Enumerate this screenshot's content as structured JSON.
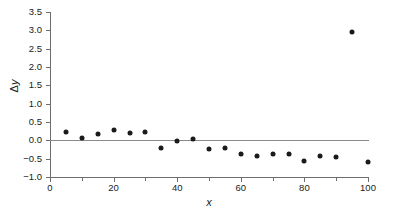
{
  "chart_data": {
    "type": "scatter",
    "title": "",
    "xlabel": "x",
    "ylabel": "Δy",
    "xlim": [
      0,
      100
    ],
    "ylim": [
      -1.0,
      3.5
    ],
    "grid": false,
    "legend": null,
    "zero_reference_line": 0.0,
    "x_ticks": [
      0,
      20,
      40,
      60,
      80,
      100
    ],
    "x_tick_labels": [
      "0",
      "20",
      "40",
      "60",
      "80",
      "100"
    ],
    "x_minor_ticks": [
      10,
      30,
      50,
      70,
      90
    ],
    "y_ticks": [
      -1.0,
      -0.5,
      0.0,
      0.5,
      1.0,
      1.5,
      2.0,
      2.5,
      3.0,
      3.5
    ],
    "y_tick_labels": [
      "−1.0",
      "−0.5",
      "0.0",
      "0.5",
      "1.0",
      "1.5",
      "2.0",
      "2.5",
      "3.0",
      "3.5"
    ],
    "marker": "filled-circle",
    "marker_color": "#1a1a1a",
    "x": [
      5,
      10,
      15,
      20,
      25,
      30,
      35,
      40,
      45,
      50,
      55,
      60,
      65,
      70,
      75,
      80,
      85,
      90,
      95,
      100
    ],
    "y": [
      0.22,
      0.07,
      0.18,
      0.27,
      0.21,
      0.22,
      -0.21,
      -0.03,
      0.04,
      -0.24,
      -0.2,
      -0.37,
      -0.42,
      -0.37,
      -0.38,
      -0.57,
      -0.44,
      -0.46,
      2.95,
      -0.59
    ],
    "points": [
      {
        "x": 5,
        "y": 0.22
      },
      {
        "x": 10,
        "y": 0.07
      },
      {
        "x": 15,
        "y": 0.18
      },
      {
        "x": 20,
        "y": 0.27
      },
      {
        "x": 25,
        "y": 0.21
      },
      {
        "x": 30,
        "y": 0.22
      },
      {
        "x": 35,
        "y": -0.21
      },
      {
        "x": 40,
        "y": -0.03
      },
      {
        "x": 45,
        "y": 0.04
      },
      {
        "x": 50,
        "y": -0.24
      },
      {
        "x": 55,
        "y": -0.2
      },
      {
        "x": 60,
        "y": -0.37
      },
      {
        "x": 65,
        "y": -0.42
      },
      {
        "x": 70,
        "y": -0.37
      },
      {
        "x": 75,
        "y": -0.38
      },
      {
        "x": 80,
        "y": -0.57
      },
      {
        "x": 85,
        "y": -0.44
      },
      {
        "x": 90,
        "y": -0.46
      },
      {
        "x": 95,
        "y": 2.95
      },
      {
        "x": 100,
        "y": -0.59
      }
    ]
  }
}
